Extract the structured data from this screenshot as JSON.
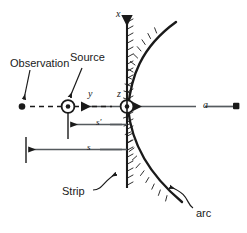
{
  "figure": {
    "kind": "physics-geometry-diagram",
    "width": 247,
    "height": 233,
    "background_color": "#ffffff",
    "ink_color": "#1a1a1a"
  },
  "axes": {
    "vertical_axis_label": "x",
    "horizontal_axis_label": "y",
    "out_of_plane_axis_label": "z"
  },
  "labels": {
    "observation": "Observation",
    "source": "Source",
    "strip": "Strip",
    "arc": "arc",
    "radius": "a",
    "distance_source": "s'",
    "distance_observation": "s",
    "axis_x": "x",
    "axis_y": "y",
    "axis_z": "z"
  },
  "points": {
    "observation_point": {
      "x": 22,
      "y": 107,
      "marker": "filled-dot"
    },
    "source_point": {
      "x": 68,
      "y": 107,
      "marker": "circled-dot"
    },
    "origin_point": {
      "x": 127,
      "y": 107,
      "marker": "circled-dot"
    },
    "radius_end_point": {
      "x": 236,
      "y": 106,
      "marker": "filled-square"
    }
  },
  "dimensions": [
    {
      "name": "s-prime",
      "label": "s'",
      "from_x": 68,
      "to_x": 127,
      "y": 125
    },
    {
      "name": "s",
      "label": "s",
      "from_x": 26,
      "to_x": 127,
      "y": 149
    },
    {
      "name": "a",
      "label": "a",
      "from_x": 236,
      "to_x": 131,
      "y": 107
    }
  ],
  "annotations": [
    {
      "name": "observation-leader",
      "label": "Observation",
      "text_x": 10,
      "text_y": 60
    },
    {
      "name": "source-leader",
      "label": "Source",
      "text_x": 70,
      "text_y": 56
    },
    {
      "name": "strip-leader",
      "label": "Strip",
      "text_x": 62,
      "text_y": 189
    },
    {
      "name": "arc-leader",
      "label": "arc",
      "text_x": 197,
      "text_y": 212
    }
  ]
}
